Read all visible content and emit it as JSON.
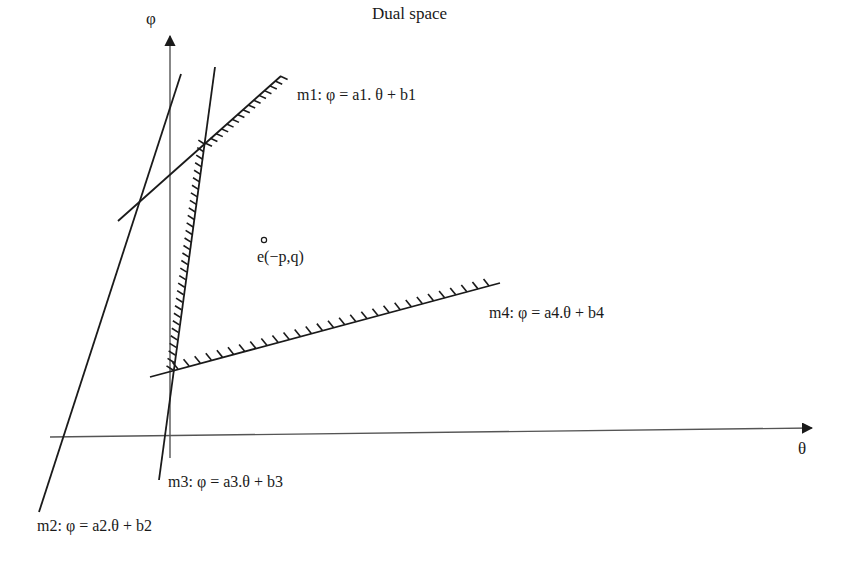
{
  "title": "Dual space",
  "axes": {
    "x_label": "θ",
    "y_label": "φ"
  },
  "lines": [
    {
      "id": "m1",
      "label": "m1: φ = a1. θ + b1",
      "hatched": true
    },
    {
      "id": "m2",
      "label": "m2: φ = a2.θ + b2",
      "hatched": false
    },
    {
      "id": "m3",
      "label": "m3: φ = a3.θ + b3",
      "hatched": true
    },
    {
      "id": "m4",
      "label": "m4: φ = a4.θ + b4",
      "hatched": true
    }
  ],
  "point": {
    "label": "e(−p,q)"
  },
  "colors": {
    "ink": "#1a1a1a",
    "axis": "#555555",
    "background": "#ffffff"
  }
}
